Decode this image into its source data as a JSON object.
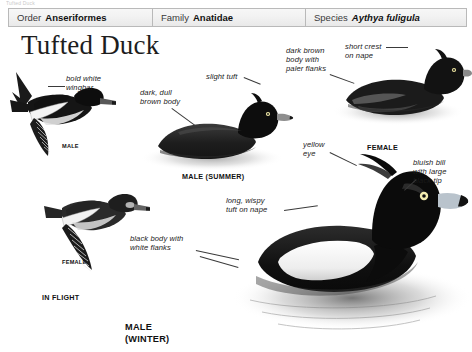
{
  "top_sliver_text": "Tufted Duck",
  "taxonomy": [
    {
      "key": "Order",
      "value": "Anseriformes",
      "italic": false
    },
    {
      "key": "Family",
      "value": "Anatidae",
      "italic": false
    },
    {
      "key": "Species",
      "value": "Aythya fuligula",
      "italic": true
    }
  ],
  "title": "Tufted Duck",
  "annotations": [
    {
      "id": "bold-white-wingbar",
      "text": "bold white\nwingbar"
    },
    {
      "id": "dark-dull-brown-body",
      "text": "dark, dull\nbrown body"
    },
    {
      "id": "slight-tuft",
      "text": "slight tuft"
    },
    {
      "id": "dark-brown-body-paler-flanks",
      "text": "dark brown\nbody with\npaler flanks"
    },
    {
      "id": "short-crest-on-nape",
      "text": "short crest\non nape"
    },
    {
      "id": "yellow-eye",
      "text": "yellow\neye"
    },
    {
      "id": "bluish-bill-black-tip",
      "text": "bluish bill\nwith large\nblack tip"
    },
    {
      "id": "long-wispy-tuft-on-nape",
      "text": "long, wispy\ntuft on nape"
    },
    {
      "id": "black-body-white-flanks",
      "text": "black body with\nwhite flanks"
    }
  ],
  "captions": [
    {
      "id": "male-in-flight",
      "text": "MALE"
    },
    {
      "id": "female-in-flight",
      "text": "FEMALE"
    },
    {
      "id": "in-flight",
      "text": "IN FLIGHT"
    },
    {
      "id": "male-summer",
      "text": "MALE (SUMMER)"
    },
    {
      "id": "female-swimming",
      "text": "FEMALE"
    },
    {
      "id": "male-winter",
      "text": "MALE\n(WINTER)"
    }
  ],
  "colors": {
    "ink": "#1a1a1a",
    "bar_fill": "#f2f2f2",
    "bar_border": "#b9b9b9",
    "plumage_dark": "#121212",
    "plumage_mid": "#4a4a4a",
    "water": "#9a9a9a",
    "paper": "#ffffff"
  }
}
